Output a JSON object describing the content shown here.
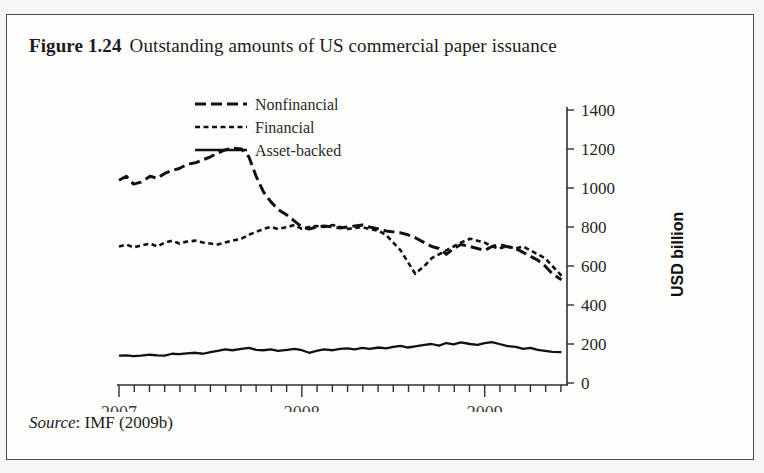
{
  "figure": {
    "number": "Figure 1.24",
    "title": "Outstanding amounts of US commercial paper issuance",
    "source_label": "Source",
    "source_text": ": IMF (2009b)"
  },
  "chart_data": {
    "type": "line",
    "title": "Outstanding amounts of US commercial paper issuance",
    "xlabel": "",
    "ylabel": "USD billion",
    "ylim": [
      0,
      1400
    ],
    "yticks": [
      0,
      200,
      400,
      600,
      800,
      1000,
      1200,
      1400
    ],
    "ytick_labels": [
      "0",
      "200",
      "400",
      "600",
      "800",
      "1000",
      "1200",
      "1400"
    ],
    "y_axis_position": "right",
    "xlim": [
      2007.0,
      2009.45
    ],
    "xticks": [
      2007,
      2008,
      2009
    ],
    "xtick_labels": [
      "2007",
      "2008",
      "2009"
    ],
    "x_minor_tick_interval_months": 1,
    "grid": false,
    "legend_position": "top-center",
    "series": [
      {
        "name": "Nonfinancial",
        "style": "long-dash",
        "color": "#111111",
        "x": [
          2007.0,
          2007.04,
          2007.08,
          2007.12,
          2007.17,
          2007.21,
          2007.25,
          2007.29,
          2007.33,
          2007.37,
          2007.42,
          2007.46,
          2007.5,
          2007.54,
          2007.58,
          2007.62,
          2007.67,
          2007.71,
          2007.75,
          2007.79,
          2007.83,
          2007.87,
          2007.92,
          2007.96,
          2008.0,
          2008.04,
          2008.08,
          2008.12,
          2008.17,
          2008.21,
          2008.25,
          2008.29,
          2008.33,
          2008.37,
          2008.42,
          2008.46,
          2008.5,
          2008.54,
          2008.58,
          2008.62,
          2008.67,
          2008.71,
          2008.75,
          2008.79,
          2008.83,
          2008.87,
          2008.92,
          2008.96,
          2009.0,
          2009.04,
          2009.08,
          2009.12,
          2009.17,
          2009.21,
          2009.25,
          2009.29,
          2009.33,
          2009.37,
          2009.42
        ],
        "values": [
          1040,
          1060,
          1020,
          1030,
          1060,
          1050,
          1075,
          1090,
          1100,
          1120,
          1130,
          1145,
          1160,
          1180,
          1195,
          1205,
          1200,
          1160,
          1060,
          980,
          930,
          890,
          860,
          830,
          800,
          790,
          800,
          805,
          800,
          795,
          800,
          805,
          810,
          800,
          790,
          780,
          775,
          770,
          760,
          745,
          720,
          700,
          690,
          660,
          690,
          710,
          700,
          690,
          680,
          700,
          710,
          700,
          690,
          670,
          650,
          630,
          600,
          560,
          530
        ]
      },
      {
        "name": "Financial",
        "style": "short-dash",
        "color": "#111111",
        "x": [
          2007.0,
          2007.04,
          2007.08,
          2007.12,
          2007.17,
          2007.21,
          2007.25,
          2007.29,
          2007.33,
          2007.37,
          2007.42,
          2007.46,
          2007.5,
          2007.54,
          2007.58,
          2007.62,
          2007.67,
          2007.71,
          2007.75,
          2007.79,
          2007.83,
          2007.87,
          2007.92,
          2007.96,
          2008.0,
          2008.04,
          2008.08,
          2008.12,
          2008.17,
          2008.21,
          2008.25,
          2008.29,
          2008.33,
          2008.37,
          2008.42,
          2008.46,
          2008.5,
          2008.54,
          2008.58,
          2008.62,
          2008.67,
          2008.71,
          2008.75,
          2008.79,
          2008.83,
          2008.87,
          2008.92,
          2008.96,
          2009.0,
          2009.04,
          2009.08,
          2009.12,
          2009.17,
          2009.21,
          2009.25,
          2009.29,
          2009.33,
          2009.37,
          2009.42
        ],
        "values": [
          700,
          710,
          695,
          705,
          715,
          700,
          720,
          730,
          715,
          725,
          730,
          720,
          715,
          710,
          720,
          730,
          740,
          760,
          775,
          790,
          800,
          790,
          800,
          810,
          790,
          800,
          805,
          800,
          810,
          800,
          790,
          795,
          800,
          790,
          780,
          760,
          720,
          680,
          620,
          560,
          600,
          640,
          660,
          680,
          700,
          720,
          740,
          730,
          720,
          700,
          690,
          700,
          690,
          700,
          680,
          660,
          640,
          600,
          550
        ]
      },
      {
        "name": "Asset-backed",
        "style": "solid",
        "color": "#111111",
        "x": [
          2007.0,
          2007.04,
          2007.08,
          2007.12,
          2007.17,
          2007.21,
          2007.25,
          2007.29,
          2007.33,
          2007.37,
          2007.42,
          2007.46,
          2007.5,
          2007.54,
          2007.58,
          2007.62,
          2007.67,
          2007.71,
          2007.75,
          2007.79,
          2007.83,
          2007.87,
          2007.92,
          2007.96,
          2008.0,
          2008.04,
          2008.08,
          2008.12,
          2008.17,
          2008.21,
          2008.25,
          2008.29,
          2008.33,
          2008.37,
          2008.42,
          2008.46,
          2008.5,
          2008.54,
          2008.58,
          2008.62,
          2008.67,
          2008.71,
          2008.75,
          2008.79,
          2008.83,
          2008.87,
          2008.92,
          2008.96,
          2009.0,
          2009.04,
          2009.08,
          2009.12,
          2009.17,
          2009.21,
          2009.25,
          2009.29,
          2009.33,
          2009.37,
          2009.42
        ],
        "values": [
          140,
          142,
          138,
          140,
          145,
          142,
          140,
          150,
          148,
          152,
          155,
          150,
          158,
          165,
          172,
          168,
          175,
          180,
          170,
          168,
          172,
          165,
          170,
          175,
          168,
          155,
          165,
          172,
          168,
          175,
          178,
          172,
          180,
          175,
          182,
          178,
          185,
          190,
          182,
          188,
          195,
          200,
          192,
          205,
          198,
          208,
          200,
          196,
          205,
          210,
          200,
          190,
          185,
          175,
          180,
          170,
          165,
          160,
          158
        ]
      }
    ]
  },
  "axis": {
    "y_title": "USD billion"
  },
  "legend": [
    {
      "label": "Nonfinancial",
      "style": "long-dash"
    },
    {
      "label": "Financial",
      "style": "short-dash"
    },
    {
      "label": "Asset-backed",
      "style": "solid"
    }
  ]
}
